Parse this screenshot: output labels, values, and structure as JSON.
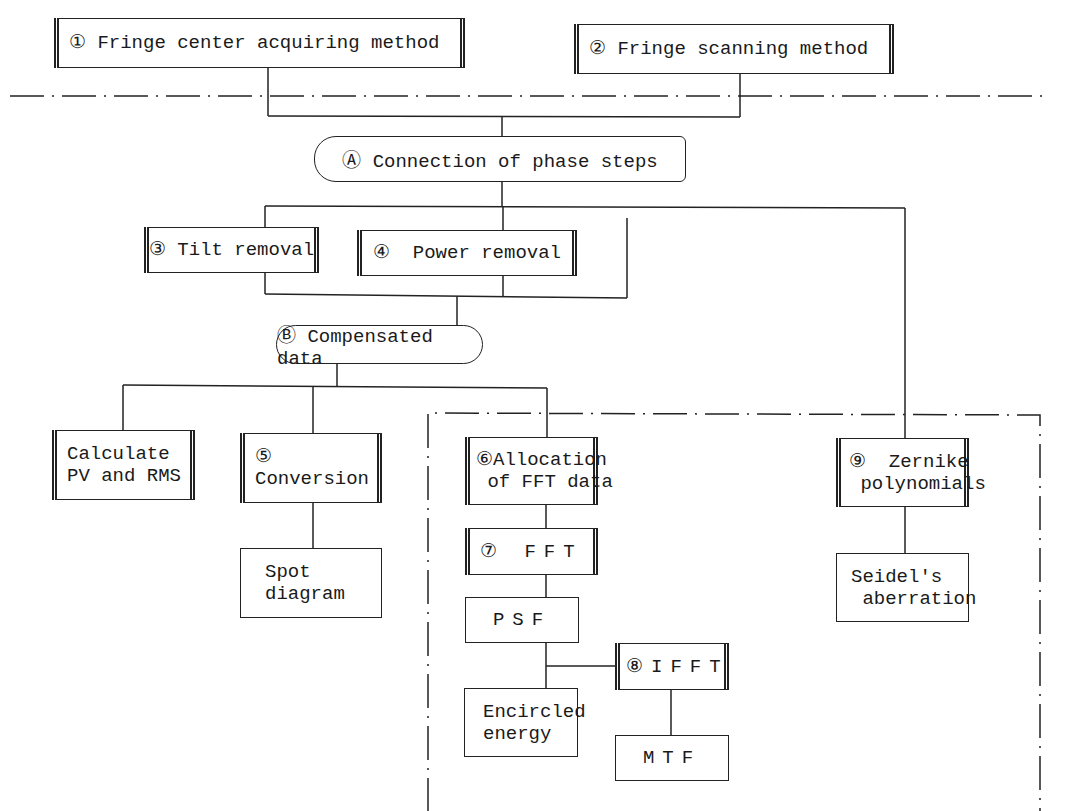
{
  "diagram": {
    "nodes": {
      "n1": {
        "label": "① Fringe center acquiring method",
        "type": "predefined-process"
      },
      "n2": {
        "label": "② Fringe scanning method",
        "type": "predefined-process"
      },
      "nA": {
        "label": "Ⓐ Connection of phase steps",
        "type": "stored-data"
      },
      "n3": {
        "label": "③ Tilt removal",
        "type": "predefined-process"
      },
      "n4": {
        "label": "④  Power removal",
        "type": "predefined-process"
      },
      "nB": {
        "label": "Ⓑ  Compensated data",
        "type": "terminal"
      },
      "pvrms": {
        "line1": "Calculate",
        "line2": "PV and RMS",
        "type": "predefined-process"
      },
      "n5": {
        "line1": "⑤",
        "line2": "Conversion",
        "type": "predefined-process"
      },
      "spot": {
        "line1": "Spot",
        "line2": "diagram",
        "type": "process"
      },
      "n6": {
        "line1": "⑥Allocation",
        "line2": " of FFT data",
        "type": "predefined-process"
      },
      "n7": {
        "label": "⑦ FFT",
        "type": "predefined-process"
      },
      "psf": {
        "label": "PSF",
        "type": "process"
      },
      "n8": {
        "label": "⑧IFFT",
        "type": "predefined-process"
      },
      "encircled": {
        "line1": "Encircled",
        "line2": "energy",
        "type": "process"
      },
      "mtf": {
        "label": "MTF",
        "type": "process"
      },
      "n9": {
        "line1": "⑨  Zernike",
        "line2": " polynomials",
        "type": "predefined-process"
      },
      "seidel": {
        "line1": "Seidel's",
        "line2": " aberration",
        "type": "process"
      }
    },
    "edges": [
      [
        "n1",
        "nA"
      ],
      [
        "n2",
        "nA"
      ],
      [
        "nA",
        "n3"
      ],
      [
        "nA",
        "n4"
      ],
      [
        "nA",
        "n9"
      ],
      [
        "n3",
        "nB"
      ],
      [
        "n4",
        "nB"
      ],
      [
        "n9-branch",
        "nB"
      ],
      [
        "nB",
        "pvrms"
      ],
      [
        "nB",
        "n5"
      ],
      [
        "nB",
        "n6"
      ],
      [
        "n5",
        "spot"
      ],
      [
        "n6",
        "n7"
      ],
      [
        "n7",
        "psf"
      ],
      [
        "psf",
        "encircled"
      ],
      [
        "psf",
        "n8"
      ],
      [
        "n8",
        "mtf"
      ],
      [
        "n9",
        "seidel"
      ]
    ],
    "regions": [
      {
        "name": "horizontal-dash-dot-separator",
        "style": "dash-dot"
      },
      {
        "name": "optional-analysis-region",
        "style": "dash-dot"
      }
    ]
  }
}
